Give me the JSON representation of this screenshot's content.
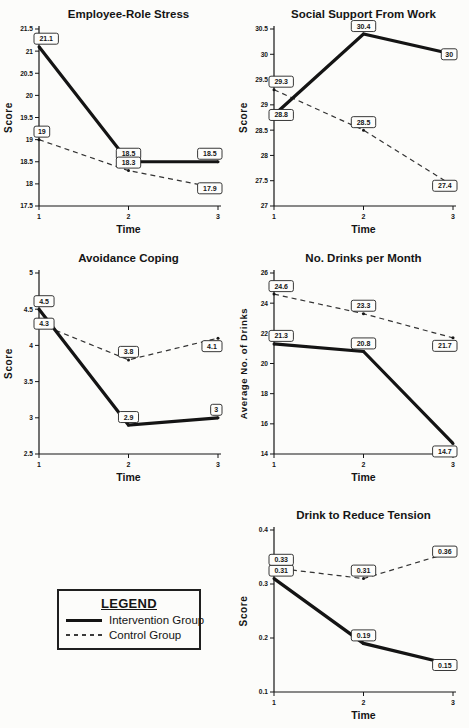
{
  "colors": {
    "ink": "#151515",
    "solid_line": "#141414",
    "dashed_line": "#333333",
    "label_box_fill": "#fdfdfb",
    "label_box_border": "#222222",
    "background": "#fcfcfa"
  },
  "legend": {
    "title": "LEGEND",
    "items": [
      {
        "label": "Intervention Group",
        "style": "solid"
      },
      {
        "label": "Control Group",
        "style": "dashed"
      }
    ]
  },
  "chart_data": [
    {
      "type": "line",
      "title": "Employee-Role Stress",
      "xlabel": "Time",
      "ylabel": "Score",
      "x": [
        1,
        2,
        3
      ],
      "xticks": [
        "1",
        "2",
        "3"
      ],
      "ylim": [
        17.5,
        21.5
      ],
      "ystep": 0.5,
      "yticks": [
        "17.5",
        "18",
        "18.5",
        "19",
        "19.5",
        "20",
        "20.5",
        "21",
        "21.5"
      ],
      "grid": false,
      "series": [
        {
          "name": "Intervention Group",
          "line": "solid",
          "values": [
            21.1,
            18.5,
            18.5
          ],
          "point_labels": [
            "21.1",
            "18.5",
            "18.5"
          ],
          "label_side": [
            "above",
            "above",
            "above"
          ]
        },
        {
          "name": "Control Group",
          "line": "dashed",
          "values": [
            19,
            18.3,
            17.9
          ],
          "point_labels": [
            "19",
            "18.3",
            "17.9"
          ],
          "label_side": [
            "above",
            "above",
            "center"
          ]
        }
      ]
    },
    {
      "type": "line",
      "title": "Social Support From Work",
      "xlabel": "Time",
      "ylabel": "Score",
      "x": [
        1,
        2,
        3
      ],
      "xticks": [
        "1",
        "2",
        "3"
      ],
      "ylim": [
        27,
        30.5
      ],
      "ystep": 0.5,
      "yticks": [
        "27",
        "27.5",
        "28",
        "28.5",
        "29",
        "29.5",
        "30",
        "30.5"
      ],
      "grid": false,
      "series": [
        {
          "name": "Intervention Group",
          "line": "solid",
          "values": [
            28.8,
            30.4,
            30
          ],
          "point_labels": [
            "28.8",
            "30.4",
            "30"
          ],
          "label_side": [
            "center",
            "above",
            "center"
          ]
        },
        {
          "name": "Control Group",
          "line": "dashed",
          "values": [
            29.3,
            28.5,
            27.4
          ],
          "point_labels": [
            "29.3",
            "28.5",
            "27.4"
          ],
          "label_side": [
            "above",
            "above",
            "center"
          ]
        }
      ]
    },
    {
      "type": "line",
      "title": "Avoidance Coping",
      "xlabel": "Time",
      "ylabel": "Score",
      "x": [
        1,
        2,
        3
      ],
      "xticks": [
        "1",
        "2",
        "3"
      ],
      "ylim": [
        2.5,
        5
      ],
      "ystep": 0.5,
      "yticks": [
        "2.5",
        "3",
        "3.5",
        "4",
        "4.5",
        "5"
      ],
      "grid": false,
      "series": [
        {
          "name": "Intervention Group",
          "line": "solid",
          "values": [
            4.5,
            2.9,
            3
          ],
          "point_labels": [
            "4.5",
            "2.9",
            "3"
          ],
          "label_side": [
            "above",
            "above",
            "above"
          ]
        },
        {
          "name": "Control Group",
          "line": "dashed",
          "values": [
            4.3,
            3.8,
            4.1
          ],
          "point_labels": [
            "4.3",
            "3.8",
            "4.1"
          ],
          "label_side": [
            "center",
            "above",
            "below"
          ]
        }
      ]
    },
    {
      "type": "line",
      "title": "No. Drinks per Month",
      "xlabel": "Time",
      "ylabel": "Average No. of Drinks",
      "x": [
        1,
        2,
        3
      ],
      "xticks": [
        "1",
        "2",
        "3"
      ],
      "ylim": [
        14,
        26
      ],
      "ystep": 2,
      "yticks": [
        "14",
        "16",
        "18",
        "20",
        "22",
        "24",
        "26"
      ],
      "grid": false,
      "series": [
        {
          "name": "Intervention Group",
          "line": "solid",
          "values": [
            21.3,
            20.8,
            14.7
          ],
          "point_labels": [
            "21.3",
            "20.8",
            "14.7"
          ],
          "label_side": [
            "above",
            "above",
            "below"
          ]
        },
        {
          "name": "Control Group",
          "line": "dashed",
          "values": [
            24.6,
            23.3,
            21.7
          ],
          "point_labels": [
            "24.6",
            "23.3",
            "21.7"
          ],
          "label_side": [
            "above",
            "above",
            "below"
          ]
        }
      ]
    },
    {
      "type": "line",
      "title": "Drink to Reduce Tension",
      "xlabel": "Time",
      "ylabel": "Score",
      "x": [
        1,
        2,
        3
      ],
      "xticks": [
        "1",
        "2",
        "3"
      ],
      "ylim": [
        0.1,
        0.4
      ],
      "ystep": 0.1,
      "yticks": [
        "0.1",
        "0.2",
        "0.3",
        "0.4"
      ],
      "grid": false,
      "series": [
        {
          "name": "Intervention Group",
          "line": "solid",
          "values": [
            0.31,
            0.19,
            0.15
          ],
          "point_labels": [
            "0.31",
            "0.19",
            "0.15"
          ],
          "label_side": [
            "above",
            "above",
            "center"
          ]
        },
        {
          "name": "Control Group",
          "line": "dashed",
          "values": [
            0.33,
            0.31,
            0.36
          ],
          "point_labels": [
            "0.33",
            "0.31",
            "0.36"
          ],
          "label_side": [
            "above",
            "above",
            "center"
          ]
        }
      ]
    }
  ]
}
